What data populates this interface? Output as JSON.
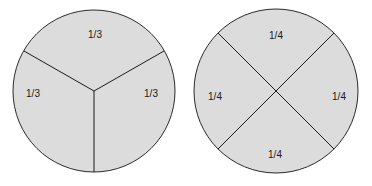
{
  "diagram": {
    "fill_color": "#dcdcdc",
    "stroke_color": "#2a2a2a",
    "thirds_circle": {
      "labels": {
        "top": "1/3",
        "left": "1/3",
        "right": "1/3"
      }
    },
    "quarters_circle": {
      "labels": {
        "top": "1/4",
        "left": "1/4",
        "right": "1/4",
        "bottom": "1/4"
      }
    }
  }
}
